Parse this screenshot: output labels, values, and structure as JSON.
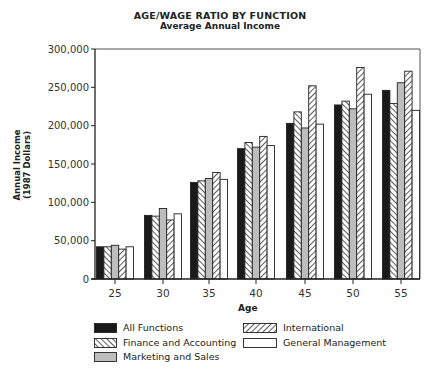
{
  "chart_data": {
    "type": "bar",
    "title": "AGE/WAGE RATIO BY FUNCTION",
    "subtitle": "Average Annual Income",
    "xlabel": "Age",
    "ylabel": "Annual Income (1987 Dollars)",
    "ylabel_line1": "Annual Income",
    "ylabel_line2": "(1987 Dollars)",
    "ylim": [
      0,
      300000
    ],
    "yticks": [
      0,
      50000,
      100000,
      150000,
      200000,
      250000,
      300000
    ],
    "ytick_labels": [
      "0",
      "50,000",
      "100,000",
      "150,000",
      "200,000",
      "250,000",
      "300,000"
    ],
    "categories": [
      "25",
      "30",
      "35",
      "40",
      "45",
      "50",
      "55"
    ],
    "grid": false,
    "legend_position": "bottom",
    "series": [
      {
        "name": "All Functions",
        "pattern": "solid-black",
        "values": [
          42000,
          83000,
          126000,
          170000,
          203000,
          227000,
          246000
        ]
      },
      {
        "name": "Finance and Accounting",
        "pattern": "hatch-backslash",
        "values": [
          42000,
          82000,
          128000,
          178000,
          218000,
          232000,
          229000
        ]
      },
      {
        "name": "Marketing and Sales",
        "pattern": "solid-gray",
        "values": [
          44000,
          92000,
          131000,
          172000,
          197000,
          222000,
          256000
        ]
      },
      {
        "name": "International",
        "pattern": "hatch-slash",
        "values": [
          39000,
          77000,
          139000,
          186000,
          252000,
          276000,
          271000
        ]
      },
      {
        "name": "General Management",
        "pattern": "white",
        "values": [
          42000,
          85000,
          130000,
          174000,
          202000,
          241000,
          220000
        ]
      }
    ]
  },
  "legend": {
    "items": [
      {
        "label": "All Functions"
      },
      {
        "label": "Finance and Accounting"
      },
      {
        "label": "Marketing and Sales"
      },
      {
        "label": "International"
      },
      {
        "label": "General Management"
      }
    ]
  },
  "colors": {
    "black": "#1a1a1a",
    "gray": "#bdbdbd",
    "line": "#333333",
    "background": "#ffffff"
  }
}
